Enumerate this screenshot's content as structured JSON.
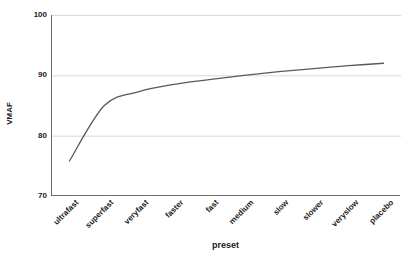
{
  "chart_data": {
    "type": "line",
    "title": "",
    "xlabel": "preset",
    "ylabel": "VMAF",
    "categories": [
      "ultrafast",
      "superfast",
      "veryfast",
      "faster",
      "fast",
      "medium",
      "slow",
      "slower",
      "veryslow",
      "placebo"
    ],
    "values": [
      75.8,
      85.0,
      87.3,
      88.5,
      89.3,
      90.0,
      90.6,
      91.1,
      91.6,
      92.0
    ],
    "ylim": [
      70,
      100
    ],
    "y_ticks": [
      70,
      80,
      90,
      100
    ],
    "grid": true,
    "legend": "none",
    "line_color": "#595959",
    "grid_color": "#d9d9d9",
    "axis_color": "#6e6e6e",
    "text_color": "#1a1a1a"
  },
  "axes": {
    "y_title": "VMAF",
    "x_title": "preset",
    "y_tick_labels": [
      "100",
      "90",
      "80",
      "70"
    ]
  }
}
